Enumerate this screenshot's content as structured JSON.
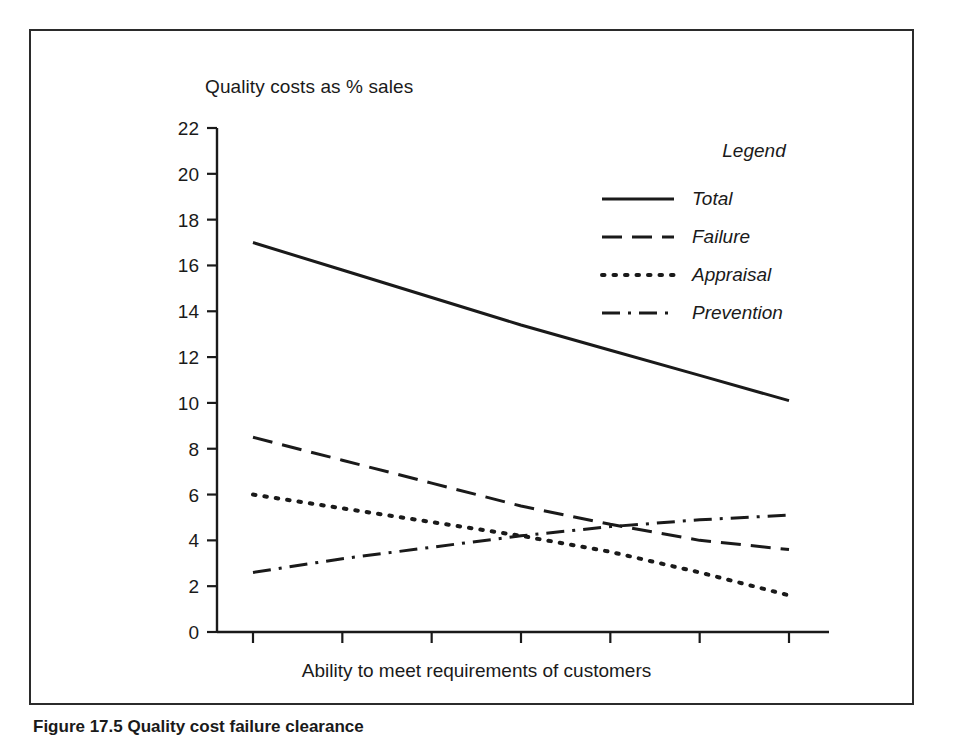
{
  "figure": {
    "caption": "Figure 17.5  Quality cost failure clearance"
  },
  "legend": {
    "title": "Legend",
    "entries": [
      {
        "label": "Total",
        "style": "solid"
      },
      {
        "label": "Failure",
        "style": "dashed"
      },
      {
        "label": "Appraisal",
        "style": "dotted"
      },
      {
        "label": "Prevention",
        "style": "dash-dot"
      }
    ]
  },
  "chart_data": {
    "type": "line",
    "title": "Quality costs as % sales",
    "xlabel": "Ability to meet requirements of customers",
    "ylabel": "Quality costs as % sales",
    "xlim": [
      0,
      7
    ],
    "ylim": [
      0,
      22
    ],
    "yticks": [
      0,
      2,
      4,
      6,
      8,
      10,
      12,
      14,
      16,
      18,
      20,
      22
    ],
    "ytick_labels": [
      "0",
      "2",
      "4",
      "6",
      "8",
      "10",
      "12",
      "14",
      "16",
      "18",
      "20",
      "22"
    ],
    "xticks": [
      1,
      2,
      3,
      4,
      5,
      6,
      7
    ],
    "xtick_labels": [
      "",
      "",
      "",
      "",
      "",
      "",
      ""
    ],
    "grid": false,
    "legend_position": "upper right",
    "x": [
      1,
      2,
      3,
      4,
      5,
      6,
      7
    ],
    "series": [
      {
        "name": "Total",
        "style": "solid",
        "color": "#1a1a1a",
        "values": [
          17.0,
          15.8,
          14.6,
          13.4,
          12.3,
          11.2,
          10.1
        ]
      },
      {
        "name": "Failure",
        "style": "dashed",
        "color": "#1a1a1a",
        "values": [
          8.5,
          7.5,
          6.5,
          5.5,
          4.7,
          4.0,
          3.6
        ]
      },
      {
        "name": "Appraisal",
        "style": "dotted",
        "color": "#1a1a1a",
        "values": [
          6.0,
          5.4,
          4.8,
          4.2,
          3.5,
          2.6,
          1.6
        ]
      },
      {
        "name": "Prevention",
        "style": "dash-dot",
        "color": "#1a1a1a",
        "values": [
          2.6,
          3.2,
          3.7,
          4.2,
          4.6,
          4.9,
          5.1
        ]
      }
    ]
  }
}
